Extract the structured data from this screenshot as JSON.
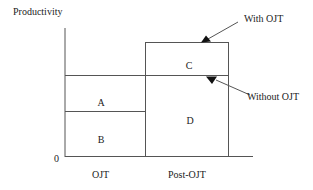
{
  "diagram": {
    "y_axis_label": "Productivity",
    "origin_label": "0",
    "x_categories": [
      "OJT",
      "Post-OJT"
    ],
    "regions": {
      "A": "A",
      "B": "B",
      "C": "C",
      "D": "D"
    },
    "annotations": {
      "with_ojt": "With OJT",
      "without_ojt": "Without OJT"
    },
    "colors": {
      "line": "#555555",
      "text": "#222222",
      "background": "#ffffff"
    }
  }
}
